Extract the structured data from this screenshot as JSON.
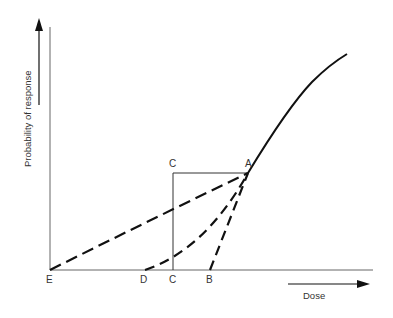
{
  "labels": {
    "y_axis": "Probability of response",
    "x_axis": "Dose",
    "point_A": "A",
    "point_B": "B",
    "point_C_top": "C",
    "point_C_bottom": "C",
    "point_D": "D",
    "point_E": "E"
  },
  "colors": {
    "line": "#111111",
    "axis": "#555555",
    "text": "#333333"
  }
}
